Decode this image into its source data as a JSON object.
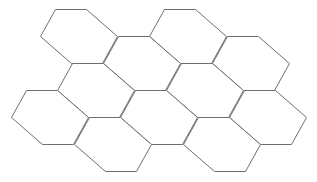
{
  "diagram": {
    "title": "",
    "background": "#ffffff",
    "stroke_color": "#6e6e6e",
    "shape": "hexagon",
    "hex_offsets": [
      [
        0,
        0
      ],
      [
        31,
        0
      ],
      [
        62,
        27
      ],
      [
        47,
        54
      ],
      [
        16,
        54
      ],
      [
        -15,
        27
      ]
    ],
    "hexagons": [
      {
        "id": "hex-1",
        "origin": [
          55,
          9
        ]
      },
      {
        "id": "hex-2",
        "origin": [
          164,
          9
        ]
      },
      {
        "id": "hex-3",
        "origin": [
          118,
          36
        ]
      },
      {
        "id": "hex-4",
        "origin": [
          227,
          36
        ]
      },
      {
        "id": "hex-5",
        "origin": [
          72,
          63
        ]
      },
      {
        "id": "hex-6",
        "origin": [
          181,
          63
        ]
      },
      {
        "id": "hex-7",
        "origin": [
          26,
          90
        ]
      },
      {
        "id": "hex-8",
        "origin": [
          135,
          90
        ]
      },
      {
        "id": "hex-9",
        "origin": [
          244,
          90
        ]
      },
      {
        "id": "hex-10",
        "origin": [
          89,
          117
        ]
      },
      {
        "id": "hex-11",
        "origin": [
          198,
          117
        ]
      }
    ]
  }
}
